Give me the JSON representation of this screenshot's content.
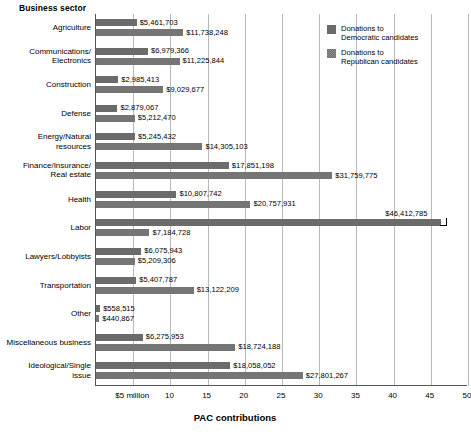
{
  "y_axis_title": "Business sector",
  "x_axis_title": "PAC contributions",
  "legend": {
    "items": [
      {
        "name": "democratic",
        "label": "Donations to\nDemocratic candidates",
        "color": "#6b6b6b"
      },
      {
        "name": "republican",
        "label": "Donations to\nRepublican candidates",
        "color": "#8d8d8d"
      }
    ]
  },
  "x_ticks": [
    {
      "value": 5,
      "label": "$5 million"
    },
    {
      "value": 10,
      "label": "10"
    },
    {
      "value": 15,
      "label": "15"
    },
    {
      "value": 20,
      "label": "20"
    },
    {
      "value": 25,
      "label": "25"
    },
    {
      "value": 30,
      "label": "30"
    },
    {
      "value": 35,
      "label": "35"
    },
    {
      "value": 40,
      "label": "40"
    },
    {
      "value": 45,
      "label": "45"
    },
    {
      "value": 50,
      "label": "50"
    }
  ],
  "chart_data": {
    "type": "bar",
    "orientation": "horizontal",
    "title": "",
    "xlabel": "PAC contributions",
    "ylabel": "Business sector",
    "xlim": [
      0,
      50
    ],
    "grid": true,
    "legend_position": "top-right",
    "units": "millions of dollars",
    "categories": [
      "Agriculture",
      "Communications/\nElectronics",
      "Construction",
      "Defense",
      "Energy/Natural\nresources",
      "Finance/Insurance/\nReal estate",
      "Health",
      "Labor",
      "Lawyers/Lobbyists",
      "Transportation",
      "Other",
      "Miscellaneous business",
      "Ideological/Single\nissue"
    ],
    "series": [
      {
        "name": "Donations to Democratic candidates",
        "values": [
          5461703,
          6979366,
          2985413,
          2879067,
          5245432,
          17851198,
          10807742,
          46412785,
          6075943,
          5407787,
          558515,
          6275953,
          18058052
        ],
        "labels": [
          "$5,461,703",
          "$6,979,366",
          "$2,985,413",
          "$2,879,067",
          "$5,245,432",
          "$17,851,198",
          "$10,807,742",
          "$46,412,785",
          "$6,075,943",
          "$5,407,787",
          "$558,515",
          "$6,275,953",
          "$18,058,052"
        ]
      },
      {
        "name": "Donations to Republican candidates",
        "values": [
          11738248,
          11225844,
          9029677,
          5212470,
          14305103,
          31759775,
          20757931,
          7184728,
          5209306,
          13122209,
          440867,
          18724188,
          27801267
        ],
        "labels": [
          "$11,738,248",
          "$11,225,844",
          "$9,029,677",
          "$5,212,470",
          "$14,305,103",
          "$31,759,775",
          "$20,757,931",
          "$7,184,728",
          "$5,209,306",
          "$13,122,209",
          "$440,867",
          "$18,724,188",
          "$27,801,267"
        ]
      }
    ]
  }
}
